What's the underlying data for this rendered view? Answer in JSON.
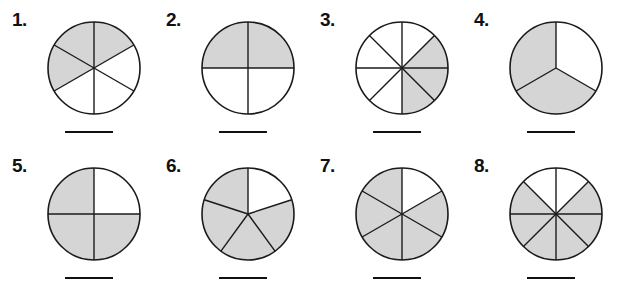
{
  "worksheet": {
    "type": "fraction-circles-worksheet",
    "background_color": "#ffffff",
    "shade_color": "#d5d5d5",
    "stroke_color": "#1a1a1a",
    "rows": 2,
    "columns": 4
  },
  "problems": [
    {
      "number": "1.",
      "parts": 6,
      "shaded": 3,
      "fraction": "3/6",
      "start_angle": 90,
      "shaded_indices": [
        0,
        5,
        4
      ],
      "answer_value": ""
    },
    {
      "number": "2.",
      "parts": 4,
      "shaded": 2,
      "fraction": "2/4",
      "start_angle": 90,
      "shaded_indices": [
        0,
        3
      ],
      "answer_value": ""
    },
    {
      "number": "3.",
      "parts": 8,
      "shaded": 3,
      "fraction": "3/8",
      "start_angle": 90,
      "shaded_indices": [
        1,
        2,
        3
      ],
      "answer_value": ""
    },
    {
      "number": "4.",
      "parts": 3,
      "shaded": 2,
      "fraction": "2/3",
      "start_angle": 90,
      "shaded_indices": [
        1,
        2
      ],
      "answer_value": ""
    },
    {
      "number": "5.",
      "parts": 4,
      "shaded": 3,
      "fraction": "3/4",
      "start_angle": 90,
      "shaded_indices": [
        1,
        2,
        3
      ],
      "answer_value": ""
    },
    {
      "number": "6.",
      "parts": 5,
      "shaded": 4,
      "fraction": "4/5",
      "start_angle": 90,
      "shaded_indices": [
        1,
        2,
        3,
        4
      ],
      "answer_value": ""
    },
    {
      "number": "7.",
      "parts": 6,
      "shaded": 5,
      "fraction": "5/6",
      "start_angle": 90,
      "shaded_indices": [
        1,
        2,
        3,
        4,
        5
      ],
      "answer_value": ""
    },
    {
      "number": "8.",
      "parts": 8,
      "shaded": 6,
      "fraction": "6/8",
      "start_angle": 90,
      "shaded_indices": [
        1,
        2,
        3,
        4,
        5,
        6
      ],
      "answer_value": ""
    }
  ]
}
